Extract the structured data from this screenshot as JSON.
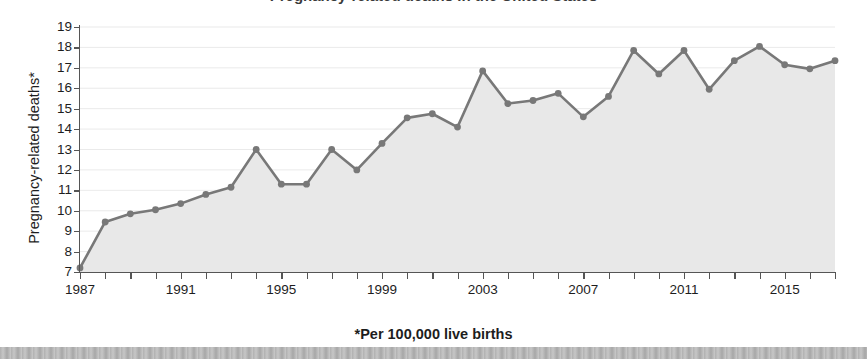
{
  "figure": {
    "title_remnant": "Pregnancy-related deaths in the United States",
    "footnote": "*Per 100,000 live births",
    "ylabel": "Pregnancy-related deaths*"
  },
  "colors": {
    "line": "#787878",
    "marker": "#787878",
    "area_fill": "#e8e8e8",
    "axis": "#555555",
    "text": "#1d1d1d",
    "bottom_strip": "#c9c9c9"
  },
  "chart_data": {
    "type": "line",
    "title": "Pregnancy-related deaths in the United States",
    "subtitle": "",
    "xlabel": "",
    "ylabel": "Pregnancy-related deaths*",
    "annotations": [
      "*Per 100,000 live births"
    ],
    "grid": true,
    "legend": "none",
    "xlim": [
      1987,
      2017
    ],
    "ylim": [
      7,
      19
    ],
    "ytick_labels": [
      "19",
      "18",
      "17",
      "16",
      "15",
      "14",
      "13",
      "12",
      "11",
      "10",
      "9",
      "8",
      "7"
    ],
    "ytick_values": [
      19,
      18,
      17,
      16,
      15,
      14,
      13,
      12,
      11,
      10,
      9,
      8,
      7
    ],
    "xtick_values": [
      1987,
      1988,
      1989,
      1990,
      1991,
      1992,
      1993,
      1994,
      1995,
      1996,
      1997,
      1998,
      1999,
      2000,
      2001,
      2002,
      2003,
      2004,
      2005,
      2006,
      2007,
      2008,
      2009,
      2010,
      2011,
      2012,
      2013,
      2014,
      2015,
      2016,
      2017
    ],
    "xtick_labels_shown": [
      "1987",
      "1991",
      "1995",
      "1999",
      "2003",
      "2007",
      "2011",
      "2015"
    ],
    "x": [
      1987,
      1988,
      1989,
      1990,
      1991,
      1992,
      1993,
      1994,
      1995,
      1996,
      1997,
      1998,
      1999,
      2000,
      2001,
      2002,
      2003,
      2004,
      2005,
      2006,
      2007,
      2008,
      2009,
      2010,
      2011,
      2012,
      2013,
      2014,
      2015,
      2016,
      2017
    ],
    "values": [
      7.2,
      9.45,
      9.85,
      10.05,
      10.35,
      10.8,
      11.15,
      13.0,
      11.3,
      11.3,
      13.0,
      12.0,
      13.3,
      14.55,
      14.75,
      14.1,
      16.85,
      15.25,
      15.4,
      15.75,
      14.6,
      15.6,
      17.85,
      16.7,
      17.85,
      15.95,
      17.35,
      18.05,
      17.15,
      16.95,
      17.35
    ],
    "series": [
      {
        "name": "Pregnancy-related mortality ratio",
        "values": [
          7.2,
          9.45,
          9.85,
          10.05,
          10.35,
          10.8,
          11.15,
          13.0,
          11.3,
          11.3,
          13.0,
          12.0,
          13.3,
          14.55,
          14.75,
          14.1,
          16.85,
          15.25,
          15.4,
          15.75,
          14.6,
          15.6,
          17.85,
          16.7,
          17.85,
          15.95,
          17.35,
          18.05,
          17.15,
          16.95,
          17.35
        ]
      }
    ]
  }
}
